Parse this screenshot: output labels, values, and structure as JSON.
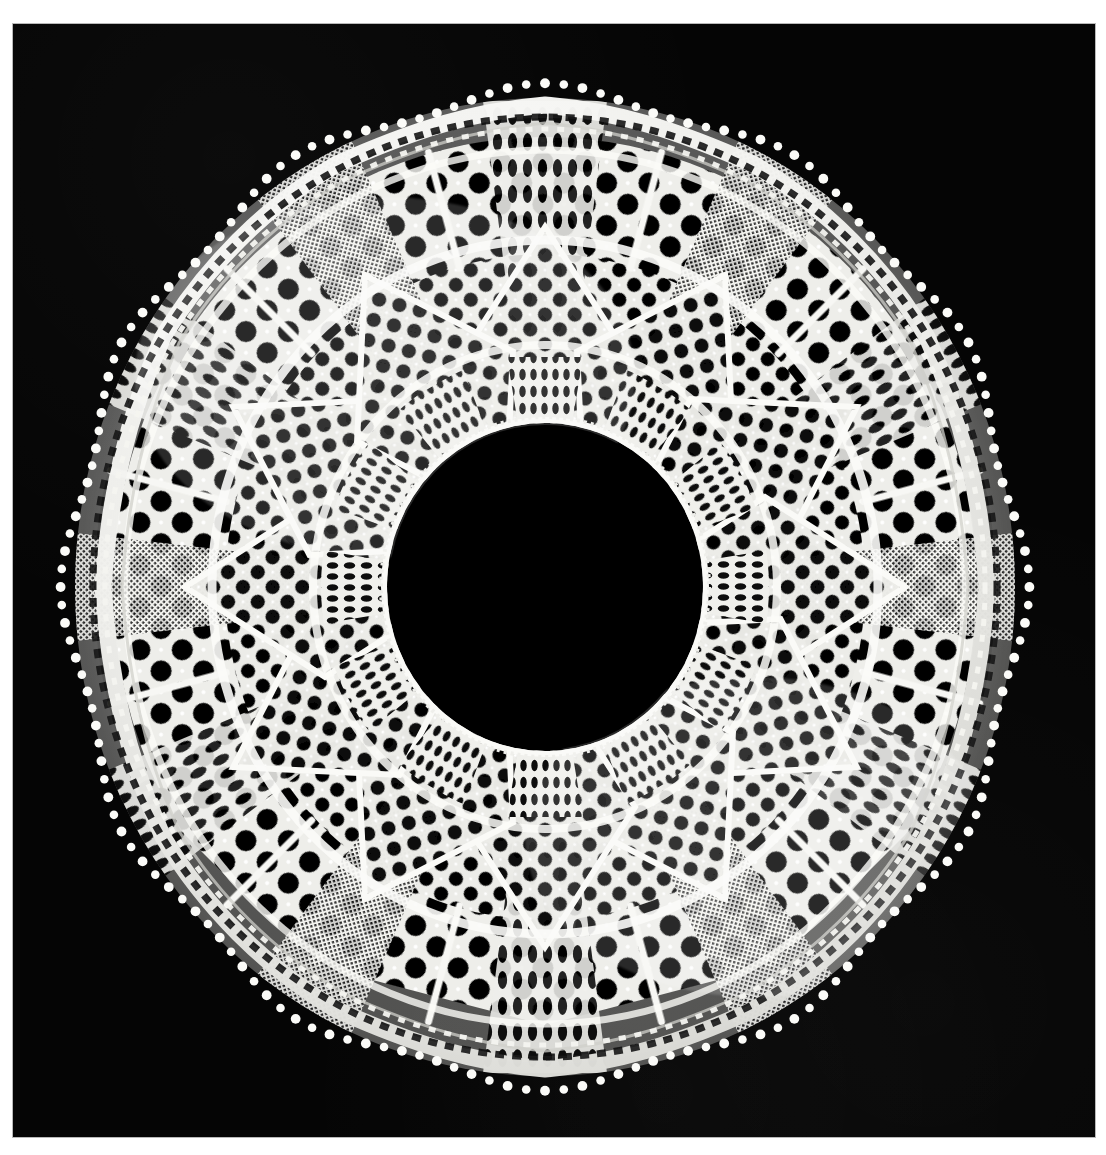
{
  "document": {
    "kind": "photograph",
    "subject": "circular knitted lace doily",
    "caption": "",
    "page_background": "#ffffff"
  },
  "photo": {
    "background_color": "#050505",
    "frame_color": "#b9b9b9",
    "left": 13,
    "top": 24,
    "width": 1082,
    "height": 1113
  },
  "doily": {
    "name": "circular-knitted-lace-doily",
    "thread_color": "#f6f6f4",
    "thread_shadow_color": "#cfcfcb",
    "hole_color": "#050505",
    "center_x": 545,
    "center_y": 586,
    "outer_radius": 492,
    "inner_hole_radius": 156,
    "sector_count": 12,
    "scallop_count": 12,
    "picot_count": 168,
    "rings": [
      {
        "name": "picot-edge",
        "r_outer": 492,
        "r_inner": 478,
        "motif": "picot-loops"
      },
      {
        "name": "outer-solid-band",
        "r_outer": 478,
        "r_inner": 462,
        "motif": "garter-band"
      },
      {
        "name": "bead-chain",
        "r_outer": 462,
        "r_inner": 450,
        "motif": "beaded-chain"
      },
      {
        "name": "outer-lattice",
        "r_outer": 450,
        "r_inner": 330,
        "motif": "diagonal-lattice-large-holes"
      },
      {
        "name": "mid-diamond-band",
        "r_outer": 330,
        "r_inner": 232,
        "motif": "diamond-medallions"
      },
      {
        "name": "inner-fan-band",
        "r_outer": 232,
        "r_inner": 168,
        "motif": "radiating-fan-net"
      },
      {
        "name": "inner-bead-rim",
        "r_outer": 168,
        "r_inner": 156,
        "motif": "beaded-chain"
      }
    ],
    "labels": {
      "title": "",
      "alt_text": "White circular lace doily with twelve radiating sectors on black ground"
    }
  },
  "chart_data": {
    "type": "pie",
    "title": "",
    "categories": [
      "sector-1",
      "sector-2",
      "sector-3",
      "sector-4",
      "sector-5",
      "sector-6",
      "sector-7",
      "sector-8",
      "sector-9",
      "sector-10",
      "sector-11",
      "sector-12"
    ],
    "values": [
      30,
      30,
      30,
      30,
      30,
      30,
      30,
      30,
      30,
      30,
      30,
      30
    ]
  }
}
